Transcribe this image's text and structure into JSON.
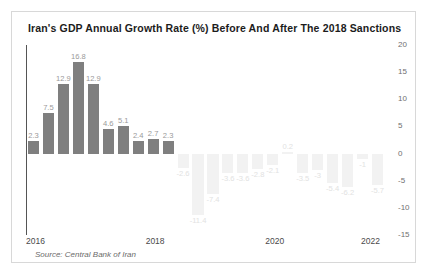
{
  "chart_data": {
    "type": "bar",
    "title": "Iran's GDP Annual Growth Rate (%) Before And After The 2018 Sanctions",
    "source": "Source: Central Bank of Iran",
    "xlabel": "",
    "ylabel": "",
    "ylim": [
      -15,
      20
    ],
    "grid": false,
    "legend": "none",
    "yticks": [
      "20",
      "15",
      "10",
      "5",
      "0",
      "-5",
      "-10",
      "-15"
    ],
    "ytick_values": [
      20,
      15,
      10,
      5,
      0,
      -5,
      -10,
      -15
    ],
    "xticks": [
      "2016",
      "2018",
      "2020",
      "2022"
    ],
    "categories": [
      "2016 Q1",
      "2016 Q2",
      "2016 Q3",
      "2016 Q4",
      "2017 Q1",
      "2017 Q2",
      "2017 Q3",
      "2017 Q4",
      "2018 Q1",
      "2018 Q2",
      "2018 Q3",
      "2018 Q4",
      "2019 Q1",
      "2019 Q2",
      "2019 Q3",
      "2019 Q4",
      "2020 Q1",
      "2020 Q2",
      "2020 Q3",
      "2020 Q4",
      "2021 Q1",
      "2021 Q2",
      "2021 Q3",
      "2021 Q4"
    ],
    "values": [
      2.3,
      7.5,
      12.9,
      16.8,
      12.9,
      4.6,
      5.1,
      2.4,
      2.7,
      2.3,
      -2.6,
      -11.4,
      -7.4,
      -3.6,
      -3.6,
      -2.8,
      -2.1,
      0.2,
      -3.5,
      -3,
      -5.4,
      -6.2,
      -1,
      -5.7
    ],
    "labels": [
      "2.3",
      "7.5",
      "12.9",
      "16.8",
      "12.9",
      "4.6",
      "5.1",
      "2.4",
      "2.7",
      "2.3",
      "-2.6",
      "-11.4",
      "-7.4",
      "-3.6",
      "-3.6",
      "-2.8",
      "-2.1",
      "0.2",
      "-3.5",
      "-3",
      "-5.4",
      "-6.2",
      "-1",
      "-5.7"
    ],
    "series_note": "Bars before the 2018 sanctions are drawn in solid dark grey; bars after the sanctions are drawn in faint light grey.",
    "colors": {
      "bar_before": "#7f7f7f",
      "bar_after": "#f2f2f2",
      "label_before": "#9a9a9a",
      "label_after": "#e2e2e2",
      "axis": "#555555",
      "frame": "#d8d8d8",
      "title": "#1c1c1c"
    }
  }
}
